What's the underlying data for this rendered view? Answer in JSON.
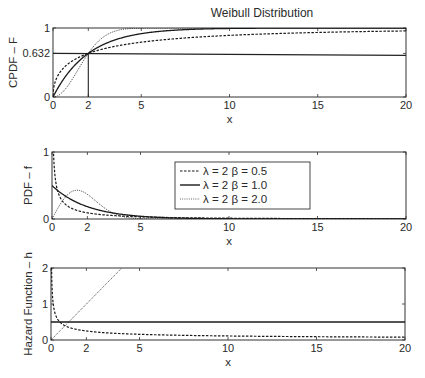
{
  "chart_data": {
    "title": "Weibull Distribution",
    "type": "line",
    "legend": {
      "position": "inside-middle-panel",
      "entries": [
        {
          "label": "λ = 2 β = 0.5",
          "style": "dashed"
        },
        {
          "label": "λ = 2 β = 1.0",
          "style": "solid"
        },
        {
          "label": "λ = 2 β = 2.0",
          "style": "dotted"
        }
      ]
    },
    "parameters": {
      "lambda": 2,
      "betas": [
        0.5,
        1.0,
        2.0
      ]
    },
    "panels": [
      {
        "id": "cdf",
        "ylabel": "CPDF – F",
        "xlabel": "x",
        "xlim": [
          0,
          20
        ],
        "ylim": [
          0,
          1
        ],
        "xticks": [
          0,
          2,
          5,
          10,
          15,
          20
        ],
        "yticks": [
          0,
          0.632,
          1
        ],
        "ytick_labels": [
          "0",
          "0.632",
          "1"
        ],
        "annotations": [
          {
            "type": "hline",
            "y": 0.632,
            "label": "0.632"
          },
          {
            "type": "vline",
            "x": 2
          }
        ],
        "series": [
          {
            "name": "λ = 2 β = 0.5",
            "function": "1 - exp(-(x/2)^0.5)",
            "sample": {
              "x": [
                0,
                1,
                2,
                5,
                10,
                20
              ],
              "y": [
                0,
                0.507,
                0.632,
                0.794,
                0.893,
                0.958
              ]
            }
          },
          {
            "name": "λ = 2 β = 1.0",
            "function": "1 - exp(-(x/2))",
            "sample": {
              "x": [
                0,
                1,
                2,
                5,
                10,
                20
              ],
              "y": [
                0,
                0.393,
                0.632,
                0.918,
                0.993,
                1.0
              ]
            }
          },
          {
            "name": "λ = 2 β = 2.0",
            "function": "1 - exp(-(x/2)^2)",
            "sample": {
              "x": [
                0,
                1,
                2,
                3,
                4,
                20
              ],
              "y": [
                0,
                0.221,
                0.632,
                0.895,
                0.982,
                1.0
              ]
            }
          }
        ]
      },
      {
        "id": "pdf",
        "ylabel": "PDF – f",
        "xlabel": "x",
        "xlim": [
          0,
          20
        ],
        "ylim": [
          0,
          1
        ],
        "xticks": [
          0,
          2,
          5,
          10,
          15,
          20
        ],
        "yticks": [
          0,
          1
        ],
        "ytick_labels": [
          "0",
          "1"
        ],
        "series": [
          {
            "name": "λ = 2 β = 0.5",
            "function": "(0.5/2)(x/2)^-0.5 exp(-(x/2)^0.5)",
            "sample": {
              "x": [
                0.05,
                0.5,
                1,
                2,
                5,
                10
              ],
              "y": [
                1.36,
                0.305,
                0.174,
                0.092,
                0.032,
                0.012
              ]
            }
          },
          {
            "name": "λ = 2 β = 1.0",
            "function": "(1/2) exp(-x/2)",
            "sample": {
              "x": [
                0,
                1,
                2,
                5,
                10
              ],
              "y": [
                0.5,
                0.303,
                0.184,
                0.041,
                0.003
              ]
            }
          },
          {
            "name": "λ = 2 β = 2.0",
            "function": "(x/2) exp(-(x/2)^2)",
            "sample": {
              "x": [
                0,
                1,
                1.41,
                2,
                3,
                4
              ],
              "y": [
                0,
                0.389,
                0.429,
                0.368,
                0.158,
                0.037
              ]
            }
          }
        ]
      },
      {
        "id": "hazard",
        "ylabel": "Hazard Function – h",
        "xlabel": "x",
        "xlim": [
          0,
          20
        ],
        "ylim": [
          0,
          2
        ],
        "xticks": [
          0,
          2,
          5,
          10,
          15,
          20
        ],
        "yticks": [
          0,
          1,
          2
        ],
        "ytick_labels": [
          "0",
          "1",
          "2"
        ],
        "series": [
          {
            "name": "λ = 2 β = 0.5",
            "function": "(0.5/2)(x/2)^-0.5",
            "sample": {
              "x": [
                0.05,
                0.5,
                1,
                2,
                5,
                20
              ],
              "y": [
                1.58,
                0.5,
                0.354,
                0.25,
                0.158,
                0.079
              ]
            }
          },
          {
            "name": "λ = 2 β = 1.0",
            "function": "1/2",
            "sample": {
              "x": [
                0,
                20
              ],
              "y": [
                0.5,
                0.5
              ]
            }
          },
          {
            "name": "λ = 2 β = 2.0",
            "function": "x/2",
            "sample": {
              "x": [
                0,
                2,
                4
              ],
              "y": [
                0,
                1,
                2
              ]
            }
          }
        ]
      }
    ]
  },
  "layout": {
    "panels_px": [
      {
        "left": 53,
        "right": 406,
        "top": 28,
        "bottom": 97
      },
      {
        "left": 52,
        "right": 406,
        "top": 152,
        "bottom": 219
      },
      {
        "left": 51,
        "right": 405,
        "top": 268,
        "bottom": 340
      }
    ]
  }
}
